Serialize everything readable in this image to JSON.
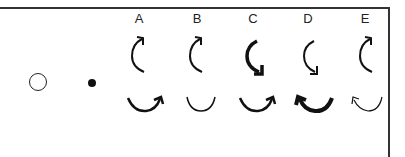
{
  "figure": {
    "reference_symbols": [
      {
        "name": "open-circle"
      },
      {
        "name": "filled-dot"
      }
    ],
    "options": [
      {
        "label": "A",
        "top_arrow": "clockwise-up, thin",
        "bottom_arrow": "clockwise, arrowhead right, thin"
      },
      {
        "label": "B",
        "top_arrow": "clockwise-up, thin",
        "bottom_arrow": "arc only, no arrowhead, thin"
      },
      {
        "label": "C",
        "top_arrow": "counterclockwise-down, thick",
        "bottom_arrow": "clockwise, arrowhead right, thin"
      },
      {
        "label": "D",
        "top_arrow": "counterclockwise-down, thin",
        "bottom_arrow": "counterclockwise, arrowhead left, thick"
      },
      {
        "label": "E",
        "top_arrow": "clockwise-up, thin",
        "bottom_arrow": "counterclockwise, arrowhead left, very thin"
      }
    ],
    "colors": {
      "stroke": "#111111",
      "frame": "#333333",
      "background": "#ffffff"
    }
  }
}
